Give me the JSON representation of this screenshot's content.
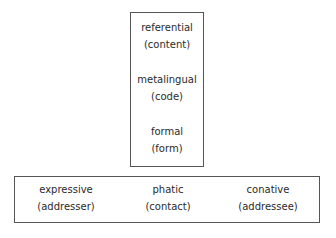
{
  "diagram": {
    "type": "jakobson-functions-of-language",
    "top_box": {
      "functions": [
        {
          "name": "referential",
          "factor": "(content)"
        },
        {
          "name": "metalingual",
          "factor": "(code)"
        },
        {
          "name": "formal",
          "factor": "(form)"
        }
      ]
    },
    "bottom_box": {
      "functions": [
        {
          "name": "expressive",
          "factor": "(addresser)"
        },
        {
          "name": "phatic",
          "factor": "(contact)"
        },
        {
          "name": "conative",
          "factor": "(addressee)"
        }
      ]
    },
    "colors": {
      "border": "#555555",
      "text": "#2a2a2a",
      "background": "#ffffff"
    }
  }
}
